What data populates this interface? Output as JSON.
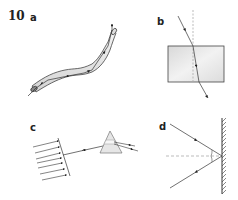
{
  "question": {
    "number": "10"
  },
  "panels": [
    {
      "label": "a",
      "subject": "optical fibre with light ray undergoing total internal reflection"
    },
    {
      "label": "b",
      "subject": "light ray refracting through a rectangular glass block with normal"
    },
    {
      "label": "c",
      "subject": "parallel rays converging into a single ray entering a prism, dispersing"
    },
    {
      "label": "d",
      "subject": "light ray reflecting from a plane mirror with normal and equal angles"
    }
  ],
  "colors": {
    "ink": "#333333",
    "fill_light": "#e8e8e8",
    "fill_mid": "#d2d2d2",
    "dashed": "#aaaaaa"
  }
}
